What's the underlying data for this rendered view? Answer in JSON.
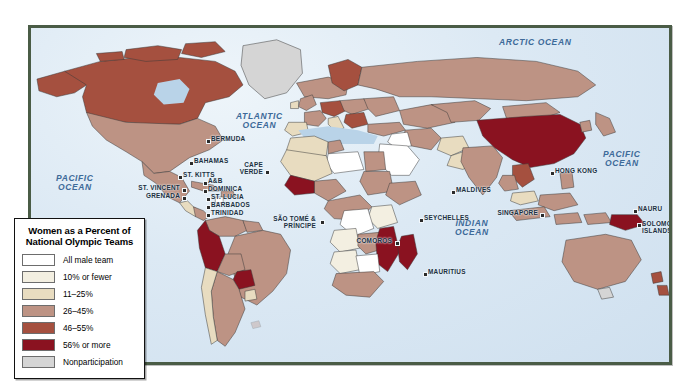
{
  "map": {
    "title": "Women as a Percent of National Olympic Teams",
    "frame_color": "#4a5c46",
    "ocean_color": "#d7e6f2",
    "ocean_labels": [
      {
        "name": "arctic-ocean",
        "text": "ARCTIC OCEAN",
        "x": 468,
        "y": 10
      },
      {
        "name": "atlantic-ocean",
        "text": "ATLANTIC\nOCEAN",
        "x": 210,
        "y": 88
      },
      {
        "name": "pacific-ocean-west",
        "text": "PACIFIC\nOCEAN",
        "x": 27,
        "y": 148
      },
      {
        "name": "pacific-ocean-east",
        "text": "PACIFIC\nOCEAN",
        "x": 573,
        "y": 124
      },
      {
        "name": "indian-ocean",
        "text": "INDIAN\nOCEAN",
        "x": 425,
        "y": 193
      }
    ],
    "place_labels": [
      {
        "name": "bermuda",
        "text": "BERMUDA",
        "x": 180,
        "y": 110,
        "align": "left",
        "dot": true
      },
      {
        "name": "bahamas",
        "text": "BAHAMAS",
        "x": 163,
        "y": 132,
        "align": "left",
        "dot": true
      },
      {
        "name": "cape-verde",
        "text": "CAPE\nVERDE",
        "x": 232,
        "y": 138,
        "align": "right",
        "dot": true
      },
      {
        "name": "st-kitts",
        "text": "ST. KITTS",
        "x": 152,
        "y": 146,
        "align": "left",
        "dot": true
      },
      {
        "name": "a-and-b",
        "text": "A&B",
        "x": 177,
        "y": 153,
        "align": "left",
        "dot": true
      },
      {
        "name": "dominica",
        "text": "DOMINICA",
        "x": 177,
        "y": 161,
        "align": "left",
        "dot": true
      },
      {
        "name": "st-vincent",
        "text": "ST. VINCENT",
        "x": 149,
        "y": 160,
        "align": "right",
        "dot": true
      },
      {
        "name": "grenada",
        "text": "GRENADA",
        "x": 149,
        "y": 167,
        "align": "right",
        "dot": true
      },
      {
        "name": "st-lucia",
        "text": "ST. LUCIA",
        "x": 180,
        "y": 169,
        "align": "left",
        "dot": true
      },
      {
        "name": "barbados",
        "text": "BARBADOS",
        "x": 180,
        "y": 177,
        "align": "left",
        "dot": true
      },
      {
        "name": "trinidad",
        "text": "TRINIDAD",
        "x": 180,
        "y": 185,
        "align": "left",
        "dot": true
      },
      {
        "name": "sao-tome-principe",
        "text": "SÃO TOMÉ &\nPRÍNCIPE",
        "x": 287,
        "y": 192,
        "align": "right",
        "dot": true
      },
      {
        "name": "comoros",
        "text": "COMOROS",
        "x": 362,
        "y": 212,
        "align": "right",
        "dot": true
      },
      {
        "name": "seychelles",
        "text": "SEYCHELLES",
        "x": 393,
        "y": 189,
        "align": "left",
        "dot": true
      },
      {
        "name": "mauritius",
        "text": "MAURITIUS",
        "x": 397,
        "y": 243,
        "align": "left",
        "dot": true
      },
      {
        "name": "maldives",
        "text": "MALDIVES",
        "x": 425,
        "y": 161,
        "align": "left",
        "dot": true
      },
      {
        "name": "singapore",
        "text": "SINGAPORE",
        "x": 507,
        "y": 184,
        "align": "right",
        "dot": true
      },
      {
        "name": "hong-kong",
        "text": "HONG KONG",
        "x": 524,
        "y": 142,
        "align": "left",
        "dot": true
      },
      {
        "name": "nauru",
        "text": "NAURU",
        "x": 607,
        "y": 180,
        "align": "left",
        "dot": true
      },
      {
        "name": "solomon-islands",
        "text": "SOLOMON\nISLANDS",
        "x": 611,
        "y": 196,
        "align": "left",
        "dot": true
      }
    ]
  },
  "legend": {
    "title": "Women as a Percent of\nNational Olympic Teams",
    "items": [
      {
        "name": "all-male-team",
        "label": "All male team",
        "color": "#ffffff"
      },
      {
        "name": "ten-or-fewer",
        "label": "10% or fewer",
        "color": "#f3efe1"
      },
      {
        "name": "eleven-25",
        "label": "11–25%",
        "color": "#e8dcc0"
      },
      {
        "name": "twentysix-45",
        "label": "26–45%",
        "color": "#bd9384"
      },
      {
        "name": "fortysix-55",
        "label": "46–55%",
        "color": "#a5503f"
      },
      {
        "name": "fiftysix-or-more",
        "label": "56% or more",
        "color": "#8a1220"
      },
      {
        "name": "nonparticipation",
        "label": "Nonparticipation",
        "color": "#d5d5d5"
      }
    ]
  },
  "chart_data": {
    "type": "map",
    "legend_position": "bottom-left",
    "categories": [
      "All male team",
      "10% or fewer",
      "11–25%",
      "26–45%",
      "46–55%",
      "56% or more",
      "Nonparticipation"
    ],
    "colors": [
      "#ffffff",
      "#f3efe1",
      "#e8dcc0",
      "#bd9384",
      "#a5503f",
      "#8a1220",
      "#d5d5d5"
    ],
    "countries": [
      {
        "name": "Canada",
        "category": "46–55%"
      },
      {
        "name": "United States",
        "category": "26–45%"
      },
      {
        "name": "Greenland",
        "category": "Nonparticipation"
      },
      {
        "name": "Mexico",
        "category": "26–45%"
      },
      {
        "name": "Brazil",
        "category": "26–45%"
      },
      {
        "name": "Peru",
        "category": "56% or more"
      },
      {
        "name": "Paraguay",
        "category": "56% or more"
      },
      {
        "name": "Argentina",
        "category": "26–45%"
      },
      {
        "name": "Chile",
        "category": "11–25%"
      },
      {
        "name": "China",
        "category": "56% or more"
      },
      {
        "name": "Russia",
        "category": "26–45%"
      },
      {
        "name": "India",
        "category": "26–45%"
      },
      {
        "name": "Australia",
        "category": "26–45%"
      },
      {
        "name": "Saudi Arabia",
        "category": "All male team"
      },
      {
        "name": "Libya",
        "category": "All male team"
      },
      {
        "name": "Iraq",
        "category": "All male team"
      },
      {
        "name": "Mozambique",
        "category": "56% or more"
      },
      {
        "name": "Madagascar",
        "category": "56% or more"
      },
      {
        "name": "Botswana",
        "category": "All male team"
      },
      {
        "name": "Angola",
        "category": "10% or fewer"
      },
      {
        "name": "Nigeria",
        "category": "26–45%"
      },
      {
        "name": "Solomon Islands",
        "category": "56% or more"
      },
      {
        "name": "Papua New Guinea",
        "category": "26–45%"
      }
    ]
  }
}
